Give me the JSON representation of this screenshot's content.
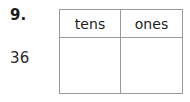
{
  "item": {
    "number_label": "9.",
    "value_label": "36"
  },
  "table": {
    "columns": [
      {
        "header": "tens",
        "value": ""
      },
      {
        "header": "ones",
        "value": ""
      }
    ]
  },
  "style": {
    "border_color": "#999999",
    "text_color": "#1b1b1b",
    "background_color": "#ffffff"
  }
}
